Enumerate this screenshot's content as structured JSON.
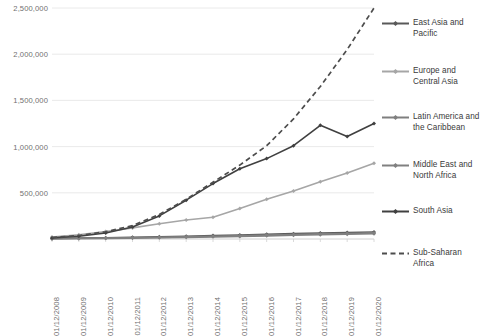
{
  "chart_data": {
    "type": "line",
    "title": "",
    "subtitle": "",
    "xlabel": "",
    "ylabel": "",
    "grid": true,
    "legend_position": "right",
    "ylim": [
      0,
      2500000
    ],
    "ytick_labels": [
      "2,500,000",
      "2,000,000",
      "1,500,000",
      "1,000,000",
      "500,000",
      ""
    ],
    "ytick_values": [
      2500000,
      2000000,
      1500000,
      1000000,
      500000,
      0
    ],
    "categories": [
      "01/12/2008",
      "01/12/2009",
      "01/12/2010",
      "01/12/2011",
      "01/12/2012",
      "01/12/2013",
      "01/12/2014",
      "01/12/2015",
      "01/12/2016",
      "01/12/2017",
      "01/12/2018",
      "01/12/2019",
      "01/12/2020"
    ],
    "series": [
      {
        "name": "East Asia and Pacific",
        "color": "#595959",
        "style": "solid",
        "marker": "diamond",
        "values": [
          6000,
          9000,
          13000,
          18000,
          24000,
          30000,
          37000,
          44000,
          52000,
          58000,
          65000,
          70000,
          76000
        ]
      },
      {
        "name": "Europe and Central Asia",
        "color": "#a6a6a6",
        "style": "solid",
        "marker": "diamond",
        "values": [
          22000,
          45000,
          80000,
          120000,
          165000,
          205000,
          235000,
          330000,
          430000,
          520000,
          620000,
          715000,
          820000
        ]
      },
      {
        "name": "Latin America and the Caribbean",
        "color": "#7f7f7f",
        "style": "solid",
        "marker": "diamond",
        "values": [
          4000,
          6000,
          9000,
          13000,
          18000,
          23000,
          29000,
          35000,
          42000,
          48000,
          55000,
          60000,
          66000
        ]
      },
      {
        "name": "Middle East and North Africa",
        "color": "#808080",
        "style": "solid",
        "marker": "diamond",
        "values": [
          3000,
          5000,
          7000,
          10000,
          14000,
          18000,
          23000,
          28000,
          34000,
          40000,
          46000,
          51000,
          57000
        ]
      },
      {
        "name": "South Asia",
        "color": "#404040",
        "style": "solid",
        "marker": "diamond",
        "values": [
          12000,
          30000,
          65000,
          130000,
          250000,
          420000,
          600000,
          760000,
          870000,
          1010000,
          1230000,
          1110000,
          1250000
        ]
      },
      {
        "name": "Sub-Saharan Africa",
        "color": "#4d4d4d",
        "style": "dashed",
        "marker": "none",
        "values": [
          15000,
          38000,
          78000,
          145000,
          265000,
          430000,
          615000,
          800000,
          1010000,
          1300000,
          1650000,
          2050000,
          2500000
        ]
      }
    ]
  },
  "legend": {
    "items": [
      {
        "label_line1": "East Asia and",
        "label_line2": "Pacific",
        "label": "East Asia and Pacific"
      },
      {
        "label_line1": "Europe and",
        "label_line2": "Central Asia",
        "label": "Europe and Central Asia"
      },
      {
        "label_line1": "Latin America and",
        "label_line2": "the Caribbean",
        "label": "Latin America and the Caribbean"
      },
      {
        "label_line1": "Middle East and",
        "label_line2": "North Africa",
        "label": "Middle East and North Africa"
      },
      {
        "label_line1": "South Asia",
        "label_line2": "",
        "label": "South Asia"
      },
      {
        "label_line1": "Sub-Saharan",
        "label_line2": "Africa",
        "label": "Sub-Saharan Africa"
      }
    ]
  },
  "colors": {
    "gridline": "#e4e4e4",
    "axis": "#d0d0d0",
    "tick_text": "#6f6f6f",
    "legend_text": "#3a3a3a",
    "background": "#ffffff"
  }
}
